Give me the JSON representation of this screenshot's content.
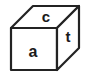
{
  "figure": {
    "name": "cube-diagram",
    "background_color": "#ffffff",
    "stroke_color": "#232323",
    "label_color": "#1a1a1a",
    "word_spelled": "cat"
  },
  "cube": {
    "faces": [
      {
        "id": "top",
        "name": "top-face",
        "label": "c",
        "label_x": 46,
        "label_y": 18,
        "font_size": 15
      },
      {
        "id": "front",
        "name": "front-face",
        "label": "a",
        "label_x": 33,
        "label_y": 53,
        "font_size": 16
      },
      {
        "id": "right",
        "name": "right-face",
        "label": "t",
        "label_x": 68,
        "label_y": 38,
        "font_size": 15
      }
    ],
    "geometry": {
      "front_top_left": [
        11,
        28
      ],
      "front_top_right": [
        57,
        28
      ],
      "front_bottom_left": [
        11,
        70
      ],
      "front_bottom_right": [
        57,
        70
      ],
      "back_top_left": [
        33,
        6
      ],
      "back_top_right": [
        79,
        6
      ],
      "back_bottom_right": [
        79,
        48
      ],
      "stroke_width": 2.2
    }
  }
}
